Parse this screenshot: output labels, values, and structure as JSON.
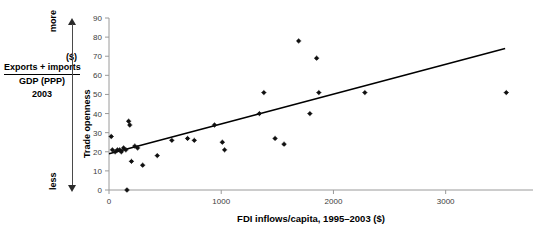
{
  "left_annotation": {
    "numerator": "Exports + imports",
    "denominator": "GDP (PPP)",
    "year": "2003",
    "unit": "($)",
    "more_label": "more",
    "less_label": "less"
  },
  "chart_data": {
    "type": "scatter",
    "title": "",
    "xlabel": "FDI inflows/capita, 1995–2003 ($)",
    "ylabel": "Trade openness",
    "xlim": [
      0,
      3600
    ],
    "ylim": [
      0,
      90
    ],
    "xticks": [
      0,
      1000,
      2000,
      3000
    ],
    "xtick_labels": [
      "0",
      "1000",
      "2000",
      "3000"
    ],
    "yticks": [
      0,
      10,
      20,
      30,
      40,
      50,
      60,
      70,
      80,
      90
    ],
    "ytick_labels": [
      "0",
      "10",
      "20",
      "30",
      "40",
      "50",
      "60",
      "70",
      "80",
      "90"
    ],
    "grid": false,
    "legend": null,
    "marker_color": "#111111",
    "trendline_color": "#000000",
    "axis_color": "#9a9a9a",
    "points": [
      {
        "x": 20,
        "y": 28
      },
      {
        "x": 30,
        "y": 21
      },
      {
        "x": 55,
        "y": 20
      },
      {
        "x": 75,
        "y": 21
      },
      {
        "x": 95,
        "y": 21
      },
      {
        "x": 110,
        "y": 20
      },
      {
        "x": 130,
        "y": 22
      },
      {
        "x": 150,
        "y": 21
      },
      {
        "x": 160,
        "y": 0
      },
      {
        "x": 175,
        "y": 36
      },
      {
        "x": 185,
        "y": 34
      },
      {
        "x": 200,
        "y": 15
      },
      {
        "x": 230,
        "y": 23
      },
      {
        "x": 255,
        "y": 22
      },
      {
        "x": 300,
        "y": 13
      },
      {
        "x": 430,
        "y": 18
      },
      {
        "x": 560,
        "y": 26
      },
      {
        "x": 700,
        "y": 27
      },
      {
        "x": 760,
        "y": 26
      },
      {
        "x": 940,
        "y": 34
      },
      {
        "x": 1010,
        "y": 25
      },
      {
        "x": 1030,
        "y": 21
      },
      {
        "x": 1340,
        "y": 40
      },
      {
        "x": 1380,
        "y": 51
      },
      {
        "x": 1480,
        "y": 27
      },
      {
        "x": 1560,
        "y": 24
      },
      {
        "x": 1690,
        "y": 78
      },
      {
        "x": 1790,
        "y": 40
      },
      {
        "x": 1850,
        "y": 69
      },
      {
        "x": 1870,
        "y": 51
      },
      {
        "x": 2280,
        "y": 51
      },
      {
        "x": 3540,
        "y": 51
      }
    ],
    "trendline": {
      "x0": 0,
      "y0": 19,
      "x1": 3530,
      "y1": 74
    }
  }
}
